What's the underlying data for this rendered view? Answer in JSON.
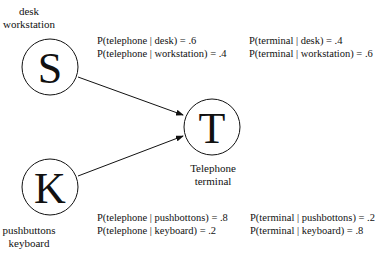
{
  "nodes": {
    "S": {
      "letter": "S",
      "label_line1": "desk",
      "label_line2": "workstation"
    },
    "K": {
      "letter": "K",
      "label_line1": "pushbuttons",
      "label_line2": "keyboard"
    },
    "T": {
      "letter": "T",
      "label_line1": "Telephone",
      "label_line2": "terminal"
    }
  },
  "edges": [
    {
      "from": "S",
      "to": "T"
    },
    {
      "from": "K",
      "to": "T"
    }
  ],
  "probabilities": {
    "S_telephone": [
      "P(telephone | desk) = .6",
      "P(telephone | workstation) = .4"
    ],
    "S_terminal": [
      "P(terminal | desk) = .4",
      "P(terminal | workstation) = .6"
    ],
    "K_telephone": [
      "P(telephone | pushbottons) = .8",
      "P(telephone | keyboard) = .2"
    ],
    "K_terminal": [
      "P(terminal | pushbottons) = .2",
      "P(terminal | keyboard) = .8"
    ]
  }
}
